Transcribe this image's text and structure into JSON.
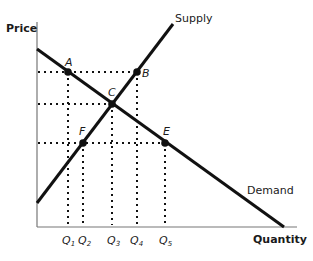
{
  "diagram": {
    "type": "supply-demand",
    "y_axis_label": "Price",
    "x_axis_label": "Quantity",
    "curves": {
      "supply": {
        "label": "Supply",
        "x1": 37,
        "y1": 203,
        "x2": 173,
        "y2": 24
      },
      "demand": {
        "label": "Demand",
        "x1": 37,
        "y1": 49,
        "x2": 284,
        "y2": 227
      }
    },
    "points": [
      {
        "name": "A",
        "x": 68,
        "y": 72
      },
      {
        "name": "B",
        "x": 137,
        "y": 72
      },
      {
        "name": "C",
        "x": 112,
        "y": 104
      },
      {
        "name": "F",
        "x": 83,
        "y": 143
      },
      {
        "name": "E",
        "x": 165,
        "y": 143
      }
    ],
    "quantity_ticks": [
      {
        "label": "Q",
        "sub": "1",
        "x": 68
      },
      {
        "label": "Q",
        "sub": "2",
        "x": 84
      },
      {
        "label": "Q",
        "sub": "3",
        "x": 112
      },
      {
        "label": "Q",
        "sub": "4",
        "x": 136
      },
      {
        "label": "Q",
        "sub": "5",
        "x": 165
      }
    ],
    "colors": {
      "line": "#111111",
      "axis": "#555555",
      "text": "#1a1a1a"
    }
  }
}
